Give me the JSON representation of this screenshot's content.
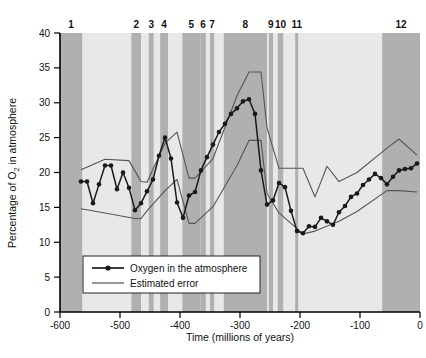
{
  "figure": {
    "background": "#ffffff",
    "plot_bg_light": "#e8e8e8",
    "plot_bg_band": "#b0b0b0",
    "curve_color": "#1a1a1a",
    "error_color": "#555555"
  },
  "axes": {
    "x_title_part1": "Time (millions of years)",
    "y_title_part1": "Percentage of O",
    "y_title_sub": "2",
    "y_title_part2": " in atmosphere",
    "x_ticks": [
      "-600",
      "-500",
      "-400",
      "-300",
      "-200",
      "-100",
      "0"
    ],
    "y_ticks": [
      "0",
      "5",
      "10",
      "15",
      "20",
      "25",
      "30",
      "35",
      "40"
    ]
  },
  "legend": {
    "items": [
      {
        "label": "Oxygen in the atmosphere",
        "style": "line-marker",
        "color": "#1a1a1a"
      },
      {
        "label": "Estimated error",
        "style": "line",
        "color": "#555555"
      }
    ]
  },
  "band_labels": [
    "1",
    "2",
    "3",
    "4",
    "5",
    "6",
    "7",
    "8",
    "9",
    "10",
    "11",
    "12"
  ],
  "chart_data": {
    "type": "line",
    "title": "",
    "xlabel": "Time (millions of years)",
    "ylabel": "Percentage of O2 in atmosphere",
    "xlim": [
      -600,
      0
    ],
    "ylim": [
      0,
      40
    ],
    "xticks": [
      -600,
      -500,
      -400,
      -300,
      -200,
      -100,
      0
    ],
    "yticks": [
      0,
      5,
      10,
      15,
      20,
      25,
      30,
      35,
      40
    ],
    "grid": false,
    "legend_position": "lower-left",
    "series": [
      {
        "name": "Oxygen in the atmosphere",
        "marker": "circle",
        "color": "#1a1a1a",
        "x": [
          -565,
          -555,
          -545,
          -535,
          -525,
          -515,
          -505,
          -495,
          -485,
          -475,
          -465,
          -455,
          -445,
          -435,
          -425,
          -415,
          -405,
          -395,
          -385,
          -375,
          -365,
          -355,
          -345,
          -335,
          -325,
          -315,
          -305,
          -295,
          -285,
          -275,
          -265,
          -255,
          -245,
          -235,
          -225,
          -215,
          -205,
          -195,
          -185,
          -175,
          -165,
          -155,
          -145,
          -135,
          -125,
          -115,
          -105,
          -95,
          -85,
          -75,
          -65,
          -55,
          -45,
          -35,
          -25,
          -15,
          -5
        ],
        "y": [
          18.7,
          18.7,
          15.6,
          18.3,
          21.0,
          21.0,
          17.6,
          20.0,
          17.8,
          14.6,
          15.6,
          17.3,
          19.0,
          22.4,
          25.0,
          22.0,
          15.7,
          13.5,
          16.7,
          17.2,
          20.3,
          22.2,
          24.0,
          25.8,
          27.0,
          28.4,
          29.2,
          30.2,
          30.5,
          28.4,
          20.3,
          15.4,
          16.0,
          18.5,
          17.9,
          14.5,
          11.6,
          11.3,
          12.3,
          12.2,
          13.5,
          13.0,
          12.5,
          14.3,
          15.2,
          16.5,
          17.0,
          18.2,
          19.0,
          19.8,
          19.2,
          18.3,
          19.4,
          20.3,
          20.5,
          20.6,
          21.3
        ]
      },
      {
        "name": "Estimated error (upper)",
        "marker": "none",
        "color": "#555555",
        "x": [
          -565,
          -525,
          -485,
          -465,
          -455,
          -425,
          -405,
          -385,
          -375,
          -345,
          -305,
          -285,
          -265,
          -255,
          -235,
          -195,
          -175,
          -155,
          -135,
          -105,
          -55,
          -35,
          -5
        ],
        "y": [
          20.4,
          21.9,
          21.7,
          18.7,
          18.6,
          24.2,
          25.8,
          19.2,
          19.2,
          22.0,
          31.0,
          34.4,
          34.4,
          26.4,
          20.6,
          20.6,
          16.5,
          20.9,
          18.7,
          20.0,
          23.5,
          24.8,
          22.5
        ]
      },
      {
        "name": "Estimated error (lower)",
        "marker": "none",
        "color": "#555555",
        "x": [
          -565,
          -525,
          -475,
          -465,
          -455,
          -425,
          -405,
          -385,
          -375,
          -345,
          -305,
          -285,
          -265,
          -255,
          -235,
          -195,
          -175,
          -135,
          -105,
          -55,
          -35,
          -5
        ],
        "y": [
          14.8,
          14.2,
          13.4,
          13.4,
          14.5,
          17.4,
          19.0,
          12.7,
          12.7,
          15.1,
          21.0,
          24.6,
          24.6,
          17.0,
          14.2,
          11.2,
          11.6,
          13.0,
          14.4,
          17.4,
          17.4,
          17.2
        ]
      }
    ],
    "shaded_bands": [
      {
        "label": "1",
        "x0": -600,
        "x1": -563
      },
      {
        "label": "2",
        "x0": -481,
        "x1": -465
      },
      {
        "label": "3",
        "x0": -452,
        "x1": -444
      },
      {
        "label": "4",
        "x0": -433,
        "x1": -420
      },
      {
        "label": "5",
        "x0": -396,
        "x1": -366
      },
      {
        "label": "6",
        "x0": -366,
        "x1": -357
      },
      {
        "label": "7",
        "x0": -350,
        "x1": -343
      },
      {
        "label": "8",
        "x0": -327,
        "x1": -255
      },
      {
        "label": "9",
        "x0": -252,
        "x1": -245
      },
      {
        "label": "10",
        "x0": -237,
        "x1": -228
      },
      {
        "label": "11",
        "x0": -208,
        "x1": -203
      },
      {
        "label": "12",
        "x0": -63,
        "x1": 0
      }
    ]
  }
}
